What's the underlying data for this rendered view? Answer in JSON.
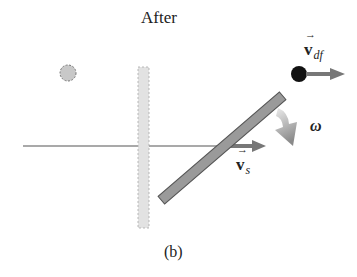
{
  "diagram": {
    "title": "After",
    "caption": "(b)",
    "labels": {
      "v_df": {
        "symbol": "v",
        "subscript": "df"
      },
      "v_s": {
        "symbol": "v",
        "subscript": "s"
      },
      "omega": "ω"
    },
    "elements": {
      "initial_disk_position": "dashed-circle",
      "initial_stick_position": "dashed-vertical-bar",
      "stick": "rotated-rod",
      "disk": "black-ball",
      "reference_line": "horizontal-line"
    },
    "colors": {
      "stick_fill": "#9a9a9a",
      "stick_stroke": "#555555",
      "ghost_fill": "#dcdcdc",
      "arrow": "#777777",
      "disk": "#111111",
      "line": "#555555"
    }
  }
}
